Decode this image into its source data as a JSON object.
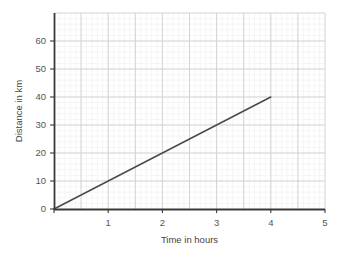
{
  "chart_data": {
    "type": "line",
    "title": "",
    "subtitle": "",
    "xlabel": "Time in hours",
    "ylabel": "Distance in km",
    "xlim": [
      0,
      5
    ],
    "ylim": [
      0,
      70
    ],
    "xticks": [
      "0",
      "1",
      "2",
      "3",
      "4",
      "5"
    ],
    "xtick_values": [
      0,
      1,
      2,
      3,
      4,
      5
    ],
    "yticks": [
      "0",
      "10",
      "20",
      "30",
      "40",
      "50",
      "60"
    ],
    "ytick_values": [
      0,
      10,
      20,
      30,
      40,
      50,
      60
    ],
    "grid": true,
    "grid_major_x_step": 0.5,
    "grid_major_y_step": 10,
    "grid_minor": true,
    "legend": null,
    "legend_position": "none",
    "annotations": [],
    "series": [
      {
        "name": "Distance travelled",
        "color": "#4a4a4a",
        "x": [
          0,
          4
        ],
        "values": [
          0,
          40
        ],
        "points": [
          {
            "x": 0,
            "y": 0
          },
          {
            "x": 1,
            "y": 10
          },
          {
            "x": 2,
            "y": 20
          },
          {
            "x": 3,
            "y": 30
          },
          {
            "x": 4,
            "y": 40
          }
        ],
        "slope": 10,
        "slope_units": "km per hour"
      }
    ]
  },
  "style": {
    "background": "#ffffff",
    "plot_background": "#ffffff",
    "axis_color": "#3a3a3a",
    "major_grid_color": "#cfcfcf",
    "minor_grid_color": "#f0f0f0",
    "tick_label_color": "#555555",
    "axis_title_color": "#444444",
    "line_color": "#4a4a4a"
  },
  "icons": {
    "chart_icon": "line-chart-icon"
  }
}
